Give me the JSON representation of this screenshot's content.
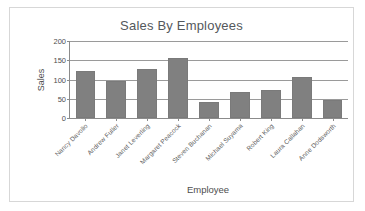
{
  "chart_data": {
    "type": "bar",
    "title": "Sales By Employees",
    "xlabel": "Employee",
    "ylabel": "Sales",
    "categories": [
      "Nancy Davolio",
      "Andrew Fuller",
      "Janet Leverling",
      "Margaret Peacock",
      "Steven Buchanan",
      "Michael Suyama",
      "Robert King",
      "Laura Callahan",
      "Anne Dodsworth"
    ],
    "values": [
      122,
      96,
      128,
      157,
      42,
      68,
      74,
      107,
      46
    ],
    "ylim": [
      0,
      200
    ],
    "yticks": [
      0,
      50,
      100,
      150,
      200
    ],
    "ytick_labels": [
      "0",
      "50",
      "100",
      "150",
      "200"
    ],
    "grid": true,
    "legend": false,
    "series_color": "#808080",
    "axis_color": "#8b8b8b",
    "grid_color": "#9a9a9a",
    "text_color": "#4d4d4d",
    "frame_color": "#d7d7d7"
  }
}
